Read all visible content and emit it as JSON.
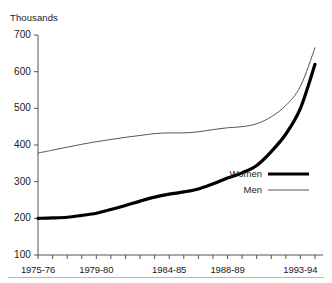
{
  "figure": {
    "unit_label": "Thousands",
    "background_color": "#ffffff",
    "axis_color": "#555555",
    "text_color": "#1a1a1a",
    "rule_color": "#b9b9b9"
  },
  "legend": {
    "position": "center-right",
    "entries": [
      {
        "label": "Women",
        "color": "#000000",
        "line_width": 3.2
      },
      {
        "label": "Men",
        "color": "#555555",
        "line_width": 1.0
      }
    ]
  },
  "axes": {
    "y_ticks": [
      "700",
      "600",
      "500",
      "400",
      "300",
      "200",
      "100"
    ],
    "x_ticks": [
      "1975-76",
      "1979-80",
      "1984-85",
      "1988-89",
      "1993-94"
    ]
  },
  "chart_data": {
    "type": "line",
    "title": "",
    "subtitle": "",
    "xlabel": "",
    "ylabel": "Thousands",
    "ylim": [
      100,
      700
    ],
    "y_ticks": [
      100,
      200,
      300,
      400,
      500,
      600,
      700
    ],
    "grid": false,
    "legend_position": "center-right",
    "annotations": [],
    "x": [
      "1975-76",
      "1976-77",
      "1977-78",
      "1978-79",
      "1979-80",
      "1980-81",
      "1981-82",
      "1982-83",
      "1983-84",
      "1984-85",
      "1985-86",
      "1986-87",
      "1987-88",
      "1988-89",
      "1989-90",
      "1990-91",
      "1991-92",
      "1992-93",
      "1993-94",
      "1994-95"
    ],
    "categories": [
      "1975-76",
      "1976-77",
      "1977-78",
      "1978-79",
      "1979-80",
      "1980-81",
      "1981-82",
      "1982-83",
      "1983-84",
      "1984-85",
      "1985-86",
      "1986-87",
      "1987-88",
      "1988-89",
      "1989-90",
      "1990-91",
      "1991-92",
      "1992-93",
      "1993-94",
      "1994-95"
    ],
    "series": [
      {
        "name": "Women",
        "color": "#000000",
        "line_width": 3.2,
        "values": [
          200,
          201,
          203,
          208,
          214,
          224,
          235,
          247,
          258,
          266,
          272,
          280,
          294,
          310,
          324,
          344,
          382,
          430,
          500,
          620
        ]
      },
      {
        "name": "Men",
        "color": "#555555",
        "line_width": 1.0,
        "values": [
          378,
          386,
          394,
          402,
          409,
          415,
          421,
          426,
          431,
          433,
          433,
          436,
          442,
          447,
          450,
          458,
          477,
          508,
          560,
          665
        ]
      }
    ]
  }
}
